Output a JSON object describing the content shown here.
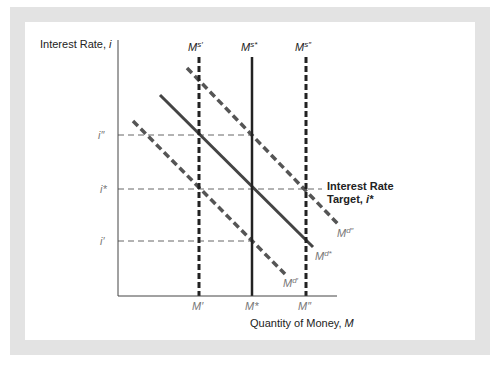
{
  "figure": {
    "y_axis_label": "Interest Rate, ",
    "y_axis_var": "i",
    "x_axis_label": "Quantity of Money, ",
    "x_axis_var": "M",
    "target_label_line1": "Interest Rate",
    "target_label_line2": "Target, ",
    "target_label_var": "i*",
    "supply_curves": [
      {
        "base": "M",
        "sup": "s′",
        "style": "dashed"
      },
      {
        "base": "M",
        "sup": "s*",
        "style": "solid"
      },
      {
        "base": "M",
        "sup": "s″",
        "style": "dashed"
      }
    ],
    "demand_curves": [
      {
        "base": "M",
        "sup": "d″",
        "style": "dashed"
      },
      {
        "base": "M",
        "sup": "d*",
        "style": "solid"
      },
      {
        "base": "M",
        "sup": "d′",
        "style": "dashed"
      }
    ],
    "y_ticks": [
      "i″",
      "i*",
      "i′"
    ],
    "x_ticks": [
      "M′",
      "M*",
      "M″"
    ]
  },
  "colors": {
    "frame": "#e3e3e3",
    "line_dark": "#333333",
    "line_dashed": "#555555",
    "guide": "#666666",
    "label_gray": "#777777"
  }
}
